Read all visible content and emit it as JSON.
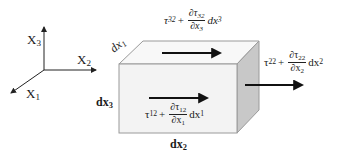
{
  "axes": {
    "x1": {
      "base": "X",
      "sub": "1"
    },
    "x2": {
      "base": "X",
      "sub": "2"
    },
    "x3": {
      "base": "X",
      "sub": "3"
    }
  },
  "box": {
    "colors": {
      "front": "#f3f3f3",
      "top": "#f8f8f8",
      "side": "#c8c8c8",
      "edge": "#9a9a9a",
      "arrow": "#111111"
    },
    "dims": {
      "dx1": {
        "base": "dx",
        "sub": "1"
      },
      "dx2": {
        "base": "dx",
        "sub": "2"
      },
      "dx3": {
        "base": "dx",
        "sub": "3"
      }
    }
  },
  "stresses": {
    "top": {
      "tau": "τ",
      "tau_sub": "32",
      "plus": "+",
      "num": "∂τ",
      "num_sub": "32",
      "den": "∂x",
      "den_sub": "3",
      "tail": "dx",
      "tail_sub": "3"
    },
    "front": {
      "tau": "τ",
      "tau_sub": "12",
      "plus": "+",
      "num": "∂τ",
      "num_sub": "12",
      "den": "∂x",
      "den_sub": "1",
      "tail": "dx",
      "tail_sub": "1"
    },
    "side": {
      "tau": "τ",
      "tau_sub": "22",
      "plus": "+",
      "num": "∂τ",
      "num_sub": "22",
      "den": "∂x",
      "den_sub": "2",
      "tail": "dx",
      "tail_sub": "2"
    }
  }
}
